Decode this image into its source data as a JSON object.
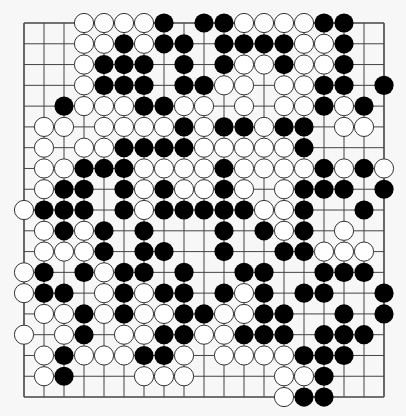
{
  "board": {
    "size": 19,
    "origin_x": 24,
    "origin_y": 23,
    "spacing_x": 20,
    "spacing_y": 20.78,
    "stone_radius": 9.6,
    "colors": {
      "background": "#f7f7f7",
      "line": "#444444",
      "black_stone": "#000000",
      "white_stone": "#ffffff",
      "white_stone_edge": "#333333"
    },
    "rows": [
      "...WWWWB.BBWWWWBB..",
      "...WWBWBB.BBBBWWB..",
      "...WBBB.B.BWWBWWB..",
      "...WBBB.BBWW.WWBB.B",
      "..BWWWBBWW.W.WWBWB.",
      ".WW.WWWWBWBBWBB.WW.",
      ".W.WWBBBBWWWWWB....",
      ".WWBBBWWWWBWWWWBWBW",
      ".WBB.BWBWWBW.WBBB.B",
      "WBBB.BWBBBBBWWB..B.",
      ".WBWB.B...B.BWB.W..",
      ".WWWB.BB..B..BBWWW.",
      "WB.BWBB.B..BB..BBB.",
      "WBB.WBWBB.BWB.BB..B",
      ".WWBWBWWBBWWBB..B.B",
      "W.WB.WWBBWWBBB.BBB.",
      ".WBWWWBBW.WWWWBBB..",
      ".WB...WWW....WWB...",
      ".............WBB..."
    ]
  }
}
